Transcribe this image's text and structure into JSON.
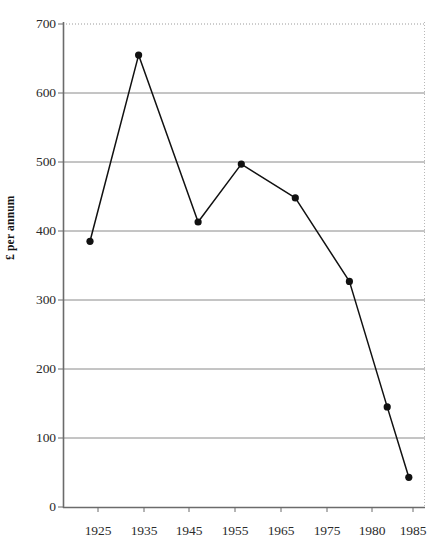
{
  "chart_data": {
    "type": "line",
    "title": "",
    "subtitle": "",
    "xlabel": "",
    "ylabel": "£ per annum",
    "x": [
      1925,
      1934,
      1945,
      1953,
      1963,
      1973,
      1980,
      1984
    ],
    "values": [
      385,
      655,
      413,
      497,
      448,
      327,
      145,
      43
    ],
    "series": [
      {
        "name": "£ per annum",
        "values": [
          385,
          655,
          413,
          497,
          448,
          327,
          145,
          43
        ]
      }
    ],
    "xlim": [
      1920,
      1987
    ],
    "ylim": [
      0,
      700
    ],
    "ytick_labels": [
      "0",
      "100",
      "200",
      "300",
      "400",
      "500",
      "600",
      "700"
    ],
    "ytick_values": [
      0,
      100,
      200,
      300,
      400,
      500,
      600,
      700
    ],
    "xtick_labels": [
      "1925",
      "1935",
      "1945",
      "1955",
      "1965",
      "1975",
      "1980",
      "1985"
    ],
    "xtick_values": [
      1925,
      1935,
      1945,
      1955,
      1965,
      1975,
      1980,
      1985
    ],
    "grid": true,
    "grid_axis": "y",
    "legend": false,
    "legend_position": "none",
    "marker": "filled-diamond",
    "line_color": "#111111",
    "marker_color": "#111111",
    "grid_color": "#808080",
    "axis_color": "#555555",
    "background_color": "#ffffff",
    "annotations": []
  },
  "axis": {
    "y_title": "£ per annum"
  }
}
